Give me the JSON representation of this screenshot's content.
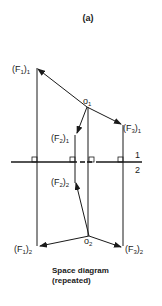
{
  "figure": {
    "title": "(a)",
    "caption_line1": "Space diagram",
    "caption_line2": "(repeated)"
  },
  "labels": {
    "F1_1": {
      "main": "(F",
      "sub1": "1",
      "close": ")",
      "sub2": "1"
    },
    "F2_1": {
      "main": "(F",
      "sub1": "2",
      "close": ")",
      "sub2": "1"
    },
    "F3_1": {
      "main": "(F",
      "sub1": "3",
      "close": ")",
      "sub2": "1"
    },
    "O1": {
      "main": "o",
      "sub": "1"
    },
    "F1_2": {
      "main": "(F",
      "sub1": "1",
      "close": ")",
      "sub2": "2"
    },
    "F2_2": {
      "main": "(F",
      "sub1": "2",
      "close": ")",
      "sub2": "2"
    },
    "F3_2": {
      "main": "(F",
      "sub1": "3",
      "close": ")",
      "sub2": "2"
    },
    "O2": {
      "main": "o",
      "sub": "2"
    },
    "plane_top": "1",
    "plane_bottom": "2"
  },
  "colors": {
    "line": "#1a1a1a",
    "background": "#ffffff"
  }
}
